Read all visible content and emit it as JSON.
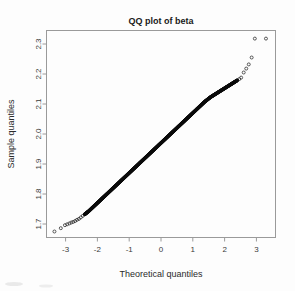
{
  "figure": {
    "title": "QQ plot of beta",
    "background_color": "#fdfdfd",
    "frame_color": "#9a9a9a",
    "point_color": "#0b0b0b"
  },
  "axes": {
    "x": {
      "label": "Theoretical quantiles",
      "ticks": [
        "-3",
        "-2",
        "-1",
        "0",
        "1",
        "2",
        "3"
      ]
    },
    "y": {
      "label": "Sample quantiles",
      "ticks": [
        "1.7",
        "1.8",
        "1.9",
        "2.0",
        "2.1",
        "2.2",
        "2.3"
      ]
    }
  },
  "chart_data": {
    "type": "scatter",
    "title": "QQ plot of beta",
    "xlabel": "Theoretical quantiles",
    "ylabel": "Sample quantiles",
    "xlim": [
      -3.6,
      3.6
    ],
    "ylim": [
      1.655,
      2.345
    ],
    "xticks": [
      -3,
      -2,
      -1,
      0,
      1,
      2,
      3
    ],
    "yticks": [
      1.7,
      1.8,
      1.9,
      2.0,
      2.1,
      2.2,
      2.3
    ],
    "grid": false,
    "legend": null,
    "series": [
      {
        "name": "sample vs theoretical quantiles",
        "marker": "open-circle",
        "x": [
          -3.35,
          -3.15,
          -3.02,
          -2.95,
          -2.88,
          -2.82,
          -2.76,
          -2.7,
          -2.64,
          -2.58,
          -2.52,
          -2.46,
          -2.4,
          -2.34,
          -2.28,
          -2.22,
          -2.16,
          -2.1,
          -2.04,
          -1.98,
          -1.92,
          -1.86,
          -1.8,
          -1.74,
          -1.68,
          -1.62,
          -1.56,
          -1.5,
          -1.44,
          -1.38,
          -1.32,
          -1.26,
          -1.2,
          -1.14,
          -1.08,
          -1.02,
          -0.96,
          -0.9,
          -0.84,
          -0.78,
          -0.72,
          -0.66,
          -0.6,
          -0.54,
          -0.48,
          -0.42,
          -0.36,
          -0.3,
          -0.24,
          -0.18,
          -0.12,
          -0.06,
          0.0,
          0.06,
          0.12,
          0.18,
          0.24,
          0.3,
          0.36,
          0.42,
          0.48,
          0.54,
          0.6,
          0.66,
          0.72,
          0.78,
          0.84,
          0.9,
          0.96,
          1.02,
          1.08,
          1.14,
          1.2,
          1.26,
          1.32,
          1.38,
          1.44,
          1.5,
          1.56,
          1.62,
          1.68,
          1.74,
          1.8,
          1.86,
          1.92,
          1.98,
          2.04,
          2.1,
          2.16,
          2.22,
          2.28,
          2.34,
          2.4,
          2.46,
          2.52,
          2.6,
          2.68,
          2.76,
          2.85,
          2.95,
          3.3
        ],
        "y": [
          1.675,
          1.686,
          1.696,
          1.699,
          1.702,
          1.705,
          1.707,
          1.71,
          1.714,
          1.717,
          1.722,
          1.727,
          1.732,
          1.737,
          1.742,
          1.748,
          1.754,
          1.76,
          1.766,
          1.772,
          1.778,
          1.784,
          1.79,
          1.796,
          1.802,
          1.808,
          1.814,
          1.82,
          1.826,
          1.832,
          1.838,
          1.844,
          1.85,
          1.856,
          1.862,
          1.868,
          1.874,
          1.88,
          1.886,
          1.892,
          1.898,
          1.904,
          1.91,
          1.916,
          1.922,
          1.928,
          1.934,
          1.94,
          1.946,
          1.952,
          1.958,
          1.964,
          1.97,
          1.976,
          1.982,
          1.988,
          1.994,
          2.0,
          2.006,
          2.012,
          2.018,
          2.024,
          2.03,
          2.036,
          2.042,
          2.048,
          2.054,
          2.06,
          2.066,
          2.072,
          2.078,
          2.084,
          2.09,
          2.096,
          2.102,
          2.108,
          2.113,
          2.118,
          2.123,
          2.127,
          2.131,
          2.135,
          2.139,
          2.143,
          2.147,
          2.151,
          2.155,
          2.159,
          2.163,
          2.167,
          2.171,
          2.175,
          2.179,
          2.183,
          2.188,
          2.205,
          2.218,
          2.232,
          2.255,
          2.318,
          2.318
        ]
      }
    ]
  }
}
